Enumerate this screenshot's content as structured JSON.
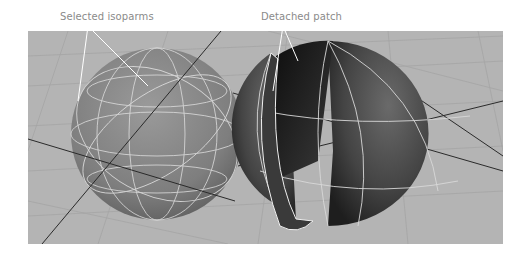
{
  "figure": {
    "annotations": [
      {
        "id": "left",
        "text": "Selected isoparms"
      },
      {
        "id": "right",
        "text": "Detached patch"
      }
    ],
    "viewports": [
      {
        "name": "sphere-with-selected-isoparms",
        "object": "NURBS sphere",
        "state": "isoparms selected"
      },
      {
        "name": "sphere-with-detached-patch",
        "object": "NURBS sphere",
        "state": "patch detached"
      }
    ],
    "colors": {
      "viewport_bg": "#b4b4b4",
      "grid_line": "#a6a6a6",
      "axis_line": "#2a2a2a",
      "isoparm": "#e8e8e8",
      "label_text": "#8a8a8a"
    }
  }
}
